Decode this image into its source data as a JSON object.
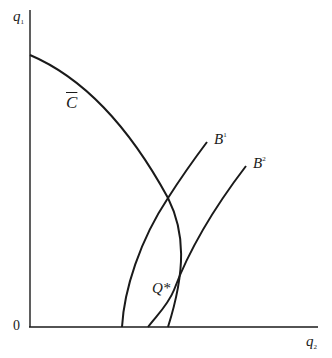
{
  "diagram": {
    "type": "economic-curve-diagram",
    "axes": {
      "y_label": "q",
      "y_label_sub": "1",
      "x_label": "q",
      "x_label_sub": "2",
      "origin_label": "0"
    },
    "curves": [
      {
        "name": "C-bar",
        "label": "C",
        "overbar": true
      },
      {
        "name": "B1",
        "label": "B",
        "superscript": "1"
      },
      {
        "name": "B2",
        "label": "B",
        "superscript": "2"
      }
    ],
    "points": [
      {
        "name": "Q-star",
        "label": "Q*"
      }
    ],
    "colors": {
      "line": "#1a1a1a",
      "background": "#ffffff"
    }
  }
}
